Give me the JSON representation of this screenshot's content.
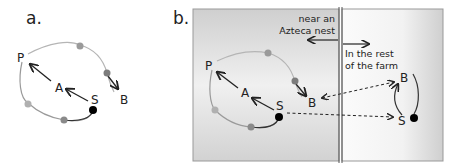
{
  "panel_a": {
    "label": "a.",
    "nodes": {
      "P": "P",
      "A": "A",
      "S": "S",
      "B": "B"
    }
  },
  "panel_b": {
    "label": "b.",
    "left_region": {
      "label_line1": "near an",
      "label_line2": "Azteca nest"
    },
    "right_region": {
      "label_line1": "In the rest",
      "label_line2": "of the farm"
    },
    "left_nodes": {
      "P": "P",
      "A": "A",
      "S": "S",
      "B": "B"
    },
    "right_nodes": {
      "B": "B",
      "S": "S"
    }
  },
  "colors": {
    "line": "#222222",
    "loop": "#a8a8a8",
    "dot_dark": "#000000",
    "dot_gray": "#8a8a8a",
    "dot_light": "#b0b0b0",
    "panel_bg_left": "#d6d6d6",
    "panel_bg_right": "#ececec"
  }
}
